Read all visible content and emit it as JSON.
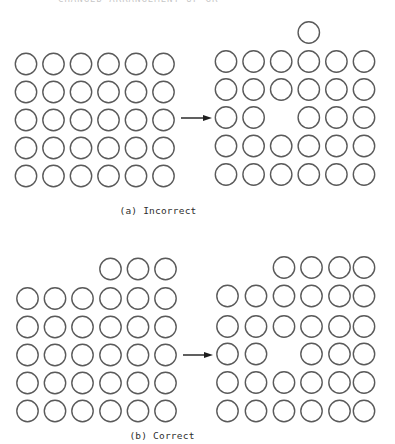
{
  "figure": {
    "header_text_cropped": "CHANGED ARRANGEMENT OF GRID",
    "stroke_color": "#5a5a5a",
    "arrow_color": "#1e1e1e",
    "circle_radius": 10.7,
    "panels": [
      {
        "id": "a",
        "caption": "(a) Incorrect",
        "caption_pos": {
          "x": 158,
          "y": 210
        },
        "before": {
          "cols": 6,
          "rows": 5,
          "col_x": [
            26,
            53.5,
            81,
            108.5,
            136,
            163.5
          ],
          "row_y": [
            64,
            92,
            120,
            148,
            176
          ],
          "extra_row_y": null,
          "extra_cols": [],
          "gaps": []
        },
        "after": {
          "cols": 6,
          "rows": 5,
          "col_x": [
            226,
            253.6,
            281.2,
            308.8,
            336.4,
            364
          ],
          "row_y": [
            61.5,
            89.5,
            117.5,
            146,
            174.5
          ],
          "extra_row_y": 32.5,
          "extra_cols": [
            3
          ],
          "gaps": [
            [
              2,
              2
            ]
          ]
        },
        "arrow": {
          "x1": 181,
          "x2": 212,
          "y": 118
        }
      },
      {
        "id": "b",
        "caption": "(b) Correct",
        "caption_pos": {
          "x": 162,
          "y": 435
        },
        "before": {
          "cols": 6,
          "rows": 5,
          "col_x": [
            27.5,
            55,
            82.5,
            110.5,
            138,
            165.5
          ],
          "row_y": [
            298.5,
            327,
            355,
            383,
            411
          ],
          "extra_row_y": 269,
          "extra_cols": [
            3,
            4,
            5
          ],
          "gaps": []
        },
        "after": {
          "cols": 6,
          "rows": 5,
          "col_x": [
            227.5,
            256,
            284,
            311.5,
            339.5,
            364
          ],
          "row_y": [
            296,
            326.5,
            354,
            382.5,
            411
          ],
          "extra_row_y": 267.5,
          "extra_cols": [
            2,
            3,
            4,
            5
          ],
          "gaps": [
            [
              2,
              2
            ]
          ]
        },
        "arrow": {
          "x1": 183,
          "x2": 213,
          "y": 355
        }
      }
    ]
  }
}
